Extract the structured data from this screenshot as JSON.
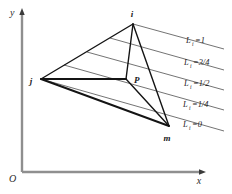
{
  "figure": {
    "background_color": "#ffffff",
    "line_color": "#1a1a1a",
    "axis_color": "#8a8a8a",
    "contour_color": "#555555"
  },
  "axes": {
    "origin_label": "O",
    "x_label": "x",
    "y_label": "y",
    "x_axis": {
      "x1": 22,
      "y1": 172,
      "x2": 207,
      "y2": 172
    },
    "y_axis": {
      "x1": 22,
      "y1": 172,
      "x2": 22,
      "y2": 12
    }
  },
  "vertices": [
    {
      "name": "i",
      "label": "i",
      "x": 133,
      "y": 24,
      "label_x": 132,
      "label_y": 16
    },
    {
      "name": "j",
      "label": "j",
      "x": 41,
      "y": 79,
      "label_x": 31,
      "label_y": 83
    },
    {
      "name": "m",
      "label": "m",
      "x": 169,
      "y": 126,
      "label_x": 166,
      "label_y": 140
    },
    {
      "name": "P",
      "label": "P",
      "x": 126,
      "y": 79,
      "label_x": 133,
      "label_y": 81
    }
  ],
  "edges": [
    {
      "from": "j",
      "to": "i",
      "width": 1.3
    },
    {
      "from": "i",
      "to": "m",
      "width": 1.3
    },
    {
      "from": "m",
      "to": "j",
      "width": 1.6
    },
    {
      "from": "j",
      "to": "P",
      "width": 1.6
    },
    {
      "from": "i",
      "to": "P",
      "width": 1.3
    },
    {
      "from": "P",
      "to": "m",
      "width": 1.3
    }
  ],
  "contours": [
    {
      "value": "1",
      "label_main": "L",
      "label_sub": "i",
      "label_rest": "=1",
      "line": {
        "x1": 133,
        "y1": 24,
        "x2": 224,
        "y2": 49
      },
      "label_x": 186,
      "label_y": 43
    },
    {
      "value": "3/4",
      "label_main": "L",
      "label_sub": "i",
      "label_rest": "=3/4",
      "line": {
        "x1": 110,
        "y1": 38,
        "x2": 224,
        "y2": 70
      },
      "label_x": 184,
      "label_y": 65
    },
    {
      "value": "1/2",
      "label_main": "L",
      "label_sub": "i",
      "label_rest": "=1/2",
      "line": {
        "x1": 87,
        "y1": 52,
        "x2": 224,
        "y2": 90
      },
      "label_x": 184,
      "label_y": 86
    },
    {
      "value": "1/4",
      "label_main": "L",
      "label_sub": "i",
      "label_rest": "=1/4",
      "line": {
        "x1": 64,
        "y1": 65,
        "x2": 224,
        "y2": 110
      },
      "label_x": 183,
      "label_y": 107
    },
    {
      "value": "0",
      "label_main": "L",
      "label_sub": "i",
      "label_rest": "=0",
      "line": {
        "x1": 41,
        "y1": 79,
        "x2": 224,
        "y2": 131
      },
      "label_x": 183,
      "label_y": 127
    }
  ]
}
